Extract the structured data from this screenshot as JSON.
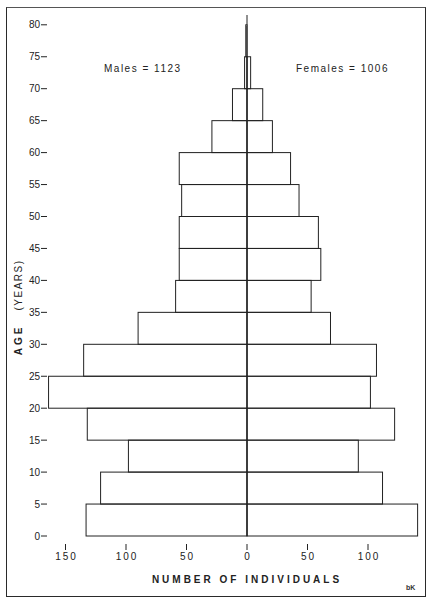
{
  "chart_data": {
    "type": "bar",
    "subtype": "population-pyramid",
    "title": "",
    "xlabel": "NUMBER OF INDIVIDUALS",
    "ylabel": "AGE (YEARS)",
    "y_ticks": [
      "0",
      "5",
      "10",
      "15",
      "20",
      "25",
      "30",
      "35",
      "40",
      "45",
      "50",
      "55",
      "60",
      "65",
      "70",
      "75",
      "80"
    ],
    "x_ticks_left": [
      "150",
      "100",
      "50"
    ],
    "x_ticks_center": "0",
    "x_ticks_right": [
      "50",
      "100"
    ],
    "categories": [
      "0-5",
      "5-10",
      "10-15",
      "15-20",
      "20-25",
      "25-30",
      "30-35",
      "35-40",
      "40-45",
      "45-50",
      "50-55",
      "55-60",
      "60-65",
      "65-70",
      "70-75",
      "75-80"
    ],
    "series": [
      {
        "name": "Males",
        "side": "left",
        "total_label": "Males = 1123",
        "values": [
          133,
          121,
          98,
          132,
          164,
          135,
          90,
          59,
          56,
          56,
          54,
          56,
          29,
          12,
          2,
          1
        ]
      },
      {
        "name": "Females",
        "side": "right",
        "total_label": "Females = 1006",
        "values": [
          141,
          112,
          92,
          122,
          102,
          107,
          69,
          53,
          61,
          59,
          43,
          36,
          21,
          13,
          3,
          0
        ]
      }
    ],
    "xlim": [
      -160,
      145
    ],
    "ylim": [
      0,
      80
    ],
    "grid": false,
    "legend_position": "top (Males left, Females right)"
  },
  "annotations": {
    "males": "Males = 1123",
    "females": "Females = 1006",
    "corner_mark": "bK",
    "axis_title_x": "NUMBER OF INDIVIDUALS",
    "axis_title_y_age": "AGE",
    "axis_title_y_years": "(YEARS)"
  }
}
